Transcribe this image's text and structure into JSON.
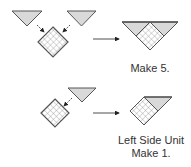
{
  "colors": {
    "triangle_fill": "#d9d9d9",
    "stroke": "#555555",
    "grid_fill": "#ffffff",
    "grid_line": "#9a9a9a",
    "arrow": "#222222",
    "text": "#333333"
  },
  "steps": [
    {
      "name": "step-1",
      "inputs": [
        "corner triangle left",
        "corner triangle right",
        "checkered square"
      ],
      "result": "square with two corner triangles (triangle unit)",
      "caption": "Make 5."
    },
    {
      "name": "step-2",
      "inputs": [
        "corner triangle",
        "checkered square"
      ],
      "result": "left side unit",
      "caption_line1": "Left Side Unit",
      "caption_line2": "Make 1."
    }
  ]
}
